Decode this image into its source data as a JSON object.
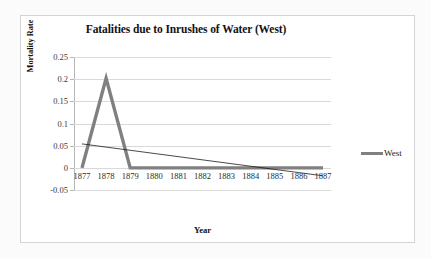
{
  "chart_data": {
    "type": "line",
    "title": "Fatalities due to Inrushes of Water (West)",
    "xlabel": "Year",
    "ylabel": "Mortality Rate",
    "categories": [
      "1877",
      "1878",
      "1879",
      "1880",
      "1881",
      "1882",
      "1883",
      "1884",
      "1885",
      "1886",
      "1887"
    ],
    "x": [
      1877,
      1878,
      1879,
      1880,
      1881,
      1882,
      1883,
      1884,
      1885,
      1886,
      1887
    ],
    "ylim": [
      -0.05,
      0.25
    ],
    "yticks": [
      0.25,
      0.2,
      0.15,
      0.1,
      0.05,
      0,
      -0.05
    ],
    "ytick_labels": [
      "0.25",
      "0.2",
      "0.15",
      "0.1",
      "0.05",
      "0",
      "-0.05"
    ],
    "grid": true,
    "legend_position": "right",
    "series": [
      {
        "name": "West",
        "color": "#808080",
        "line_width": 3.4,
        "values": [
          0,
          0.202,
          0,
          0,
          0,
          0,
          0,
          0,
          0,
          0,
          0
        ]
      }
    ],
    "trendline": {
      "name": "Linear (West)",
      "color": "#1a1a1a",
      "line_width": 0.8,
      "from": {
        "x": 1877,
        "y": 0.054
      },
      "to": {
        "x": 1887,
        "y": -0.018
      }
    }
  },
  "legend": {
    "entries": [
      {
        "label": "West",
        "color": "#808080"
      }
    ]
  }
}
